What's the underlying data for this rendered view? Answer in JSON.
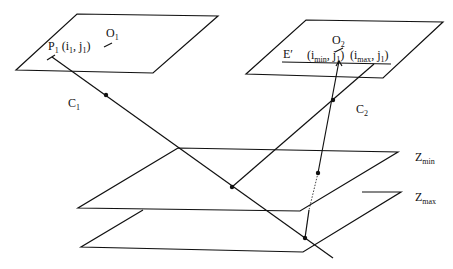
{
  "diagram": {
    "type": "epipolar-geometry",
    "labels": {
      "p1": "P",
      "p1_sub": "1",
      "p1_coords_open": " (i",
      "p1_coords_i_sub": "1",
      "p1_coords_mid": ", j",
      "p1_coords_j_sub": "1",
      "p1_coords_close": ")",
      "o1": "O",
      "o1_sub": "1",
      "o2": "O",
      "o2_sub": "2",
      "c1": "C",
      "c1_sub": "1",
      "c2": "C",
      "c2_sub": "2",
      "e_prime": "E′",
      "imin_open": "(i",
      "imin_sub": "min",
      "imin_mid": ", j",
      "imin_j_sub": "1",
      "imin_close": ")",
      "imax_open": "(i",
      "imax_sub": "max",
      "imax_mid": ", j",
      "imax_j_sub": "1",
      "imax_close": ")",
      "zmin": "Z",
      "zmin_sub": "min",
      "zmax": "Z",
      "zmax_sub": "max"
    },
    "colors": {
      "stroke": "#111111",
      "background": "#ffffff"
    }
  }
}
